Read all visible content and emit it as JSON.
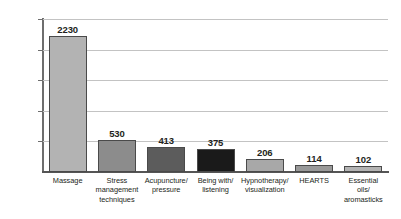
{
  "chart_data": {
    "type": "bar",
    "title": "",
    "subtitle": "",
    "xlabel": "",
    "ylabel": "",
    "ylim": [
      0,
      2500
    ],
    "yticks": [
      0,
      500,
      1000,
      1500,
      2000,
      2500
    ],
    "ytick_labels": [
      "0",
      "500",
      "1000",
      "1500",
      "2000",
      "2500"
    ],
    "grid": "horizontal",
    "legend": "none",
    "categories": [
      "Massage",
      "Stress management techniques",
      "Acupuncture/ pressure",
      "Being with/ listening",
      "Hypnotherapy/ visualization",
      "HEARTS",
      "Essential oils/ aromasticks"
    ],
    "category_lines": [
      [
        "Massage"
      ],
      [
        "Stress",
        "management",
        "techniques"
      ],
      [
        "Acupuncture/",
        "pressure"
      ],
      [
        "Being with/",
        "listening"
      ],
      [
        "Hypnotherapy/",
        "visualization"
      ],
      [
        "HEARTS"
      ],
      [
        "Essential",
        "oils/",
        "aromasticks"
      ]
    ],
    "values": [
      2230,
      530,
      413,
      375,
      206,
      114,
      102
    ],
    "value_labels": [
      "2230",
      "530",
      "413",
      "375",
      "206",
      "114",
      "102"
    ],
    "bar_colors": [
      "#b3b3b3",
      "#8c8c8c",
      "#5c5c5c",
      "#1a1a1a",
      "#a8a8a8",
      "#999999",
      "#b3b3b3"
    ],
    "bar_border_color": "#4a4a4a",
    "gridline_color": "#c3c3c3",
    "axis_color": "#6e6e6e",
    "text_color": "#231f20",
    "background_color": "#ffffff"
  }
}
